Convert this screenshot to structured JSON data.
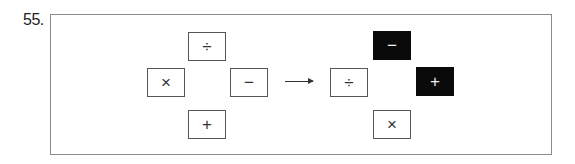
{
  "problem_number": "55.",
  "left_figure": {
    "top": {
      "symbol": "÷",
      "filled": false
    },
    "left": {
      "symbol": "×",
      "filled": false
    },
    "right": {
      "symbol": "−",
      "filled": false
    },
    "bottom": {
      "symbol": "+",
      "filled": false
    }
  },
  "arrow": "right-arrow",
  "right_figure": {
    "top": {
      "symbol": "−",
      "filled": true
    },
    "left": {
      "symbol": "÷",
      "filled": false
    },
    "right": {
      "symbol": "+",
      "filled": true
    },
    "bottom": {
      "symbol": "×",
      "filled": false
    }
  },
  "colors": {
    "filled_box": "#0a0a0a",
    "border": "#555555",
    "frame": "#8a8a8a"
  }
}
